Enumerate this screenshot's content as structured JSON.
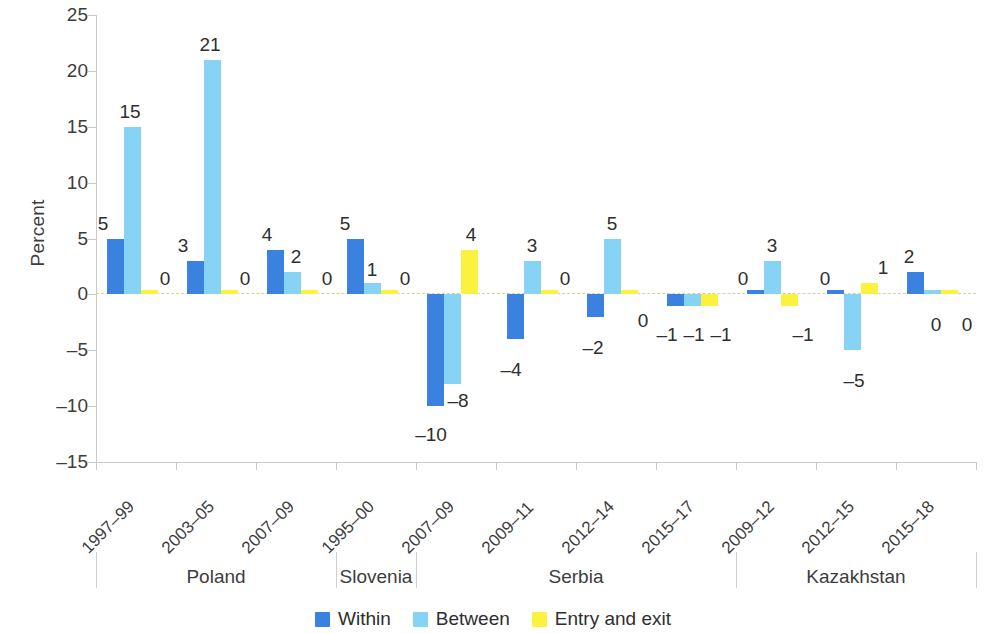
{
  "chart_data": {
    "type": "bar",
    "title": "",
    "subtitle": "",
    "xlabel": "",
    "ylabel": "Percent",
    "ylim": [
      -15,
      25
    ],
    "yticks": [
      25,
      20,
      15,
      10,
      5,
      0,
      -5,
      -10,
      -15
    ],
    "grid": false,
    "zero_line": true,
    "legend_position": "bottom",
    "orientation": "vertical",
    "series": [
      {
        "name": "Within",
        "color": "#3b82e0",
        "values": [
          5,
          3,
          4,
          5,
          -10,
          -4,
          -2,
          -1,
          0,
          0,
          2
        ]
      },
      {
        "name": "Between",
        "color": "#87d3f5",
        "values": [
          15,
          21,
          2,
          1,
          -8,
          3,
          5,
          -1,
          3,
          -5,
          0
        ]
      },
      {
        "name": "Entry and exit",
        "color": "#faf23f",
        "values": [
          0,
          0,
          0,
          0,
          4,
          0,
          0,
          -1,
          -1,
          1,
          0
        ]
      }
    ],
    "categories": [
      "1997–99",
      "2003–05",
      "2007–09",
      "1995–00",
      "2007–09",
      "2009–11",
      "2012–14",
      "2015–17",
      "2009–12",
      "2012–15",
      "2015–18"
    ],
    "groups": [
      {
        "label": "Poland",
        "categories": [
          "1997–99",
          "2003–05",
          "2007–09"
        ]
      },
      {
        "label": "Slovenia",
        "categories": [
          "1995–00"
        ]
      },
      {
        "label": "Serbia",
        "categories": [
          "2007–09",
          "2009–11",
          "2012–14",
          "2015–17"
        ]
      },
      {
        "label": "Kazakhstan",
        "categories": [
          "2009–12",
          "2012–15",
          "2015–18"
        ]
      }
    ],
    "data_labels": [
      {
        "category": "1997–99",
        "Within": "5",
        "Between": "15",
        "Entry and exit": "0"
      },
      {
        "category": "2003–05",
        "Within": "3",
        "Between": "21",
        "Entry and exit": "0"
      },
      {
        "category": "2007–09",
        "Within": "4",
        "Between": "2",
        "Entry and exit": "0"
      },
      {
        "category": "1995–00",
        "Within": "5",
        "Between": "1",
        "Entry and exit": "0"
      },
      {
        "category": "2007–09",
        "Within": "–10",
        "Between": "–8",
        "Entry and exit": "4"
      },
      {
        "category": "2009–11",
        "Within": "–4",
        "Between": "3",
        "Entry and exit": "0"
      },
      {
        "category": "2012–14",
        "Within": "–2",
        "Between": "5",
        "Entry and exit": "0"
      },
      {
        "category": "2015–17",
        "Within": "–1",
        "Between": "–1",
        "Entry and exit": "–1"
      },
      {
        "category": "2009–12",
        "Within": "0",
        "Between": "3",
        "Entry and exit": "–1"
      },
      {
        "category": "2012–15",
        "Within": "0",
        "Between": "–5",
        "Entry and exit": "1"
      },
      {
        "category": "2015–18",
        "Within": "2",
        "Between": "0",
        "Entry and exit": "0"
      }
    ]
  },
  "legend": {
    "items": [
      {
        "label": "Within",
        "color": "#3b82e0"
      },
      {
        "label": "Between",
        "color": "#87d3f5"
      },
      {
        "label": "Entry and exit",
        "color": "#faf23f"
      }
    ]
  },
  "axis": {
    "y_title": "Percent",
    "y_ticks": [
      "25",
      "20",
      "15",
      "10",
      "5",
      "0",
      "–5",
      "–10",
      "–15"
    ]
  },
  "colors": {
    "within": "#3b82e0",
    "between": "#87d3f5",
    "entry_and_exit": "#faf23f",
    "axis": "#c9c9c9",
    "zero_line": "#d9cf9f",
    "text": "#3d3d3d"
  }
}
